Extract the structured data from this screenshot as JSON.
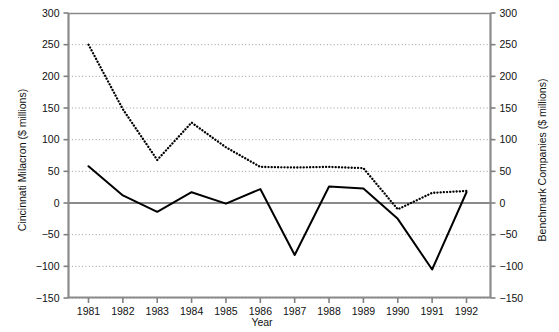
{
  "chart_data": {
    "type": "line",
    "title": "",
    "xlabel": "Year",
    "ylabel_left": "Cincinnati Milacron ($ millions)",
    "ylabel_right": "Benchmark Companies ($ millions)",
    "categories": [
      1981,
      1982,
      1983,
      1984,
      1985,
      1986,
      1987,
      1988,
      1989,
      1990,
      1991,
      1992
    ],
    "x_tick_labels": [
      "1981",
      "1982",
      "1983",
      "1984",
      "1985",
      "1986",
      "1987",
      "1988",
      "1989",
      "1990",
      "1991",
      "1992"
    ],
    "y_tick_labels_left": [
      "300",
      "250",
      "200",
      "150",
      "100",
      "50",
      "0",
      "-50",
      "-100",
      "-150"
    ],
    "y_tick_labels_right": [
      "300",
      "250",
      "200",
      "150",
      "100",
      "50",
      "0",
      "-50",
      "-100",
      "-150"
    ],
    "y_tick_values": [
      300,
      250,
      200,
      150,
      100,
      50,
      0,
      -50,
      -100,
      -150
    ],
    "ylim": [
      -150,
      300
    ],
    "ylim_right": [
      -150,
      300
    ],
    "grid": true,
    "legend": "none",
    "series": [
      {
        "name": "Cincinnati Milacron ($ millions)",
        "axis": "left",
        "style": "solid",
        "color": "#000000",
        "values": [
          58,
          12,
          -14,
          17,
          -1,
          22,
          -82,
          26,
          23,
          -25,
          -105,
          17
        ]
      },
      {
        "name": "Benchmark Companies ($ millions)",
        "axis": "right",
        "style": "dotted",
        "color": "#000000",
        "values": [
          250,
          148,
          68,
          127,
          88,
          57,
          56,
          57,
          55,
          -10,
          16,
          19
        ]
      }
    ],
    "annotations": []
  },
  "colors": {
    "axis": "#808080",
    "grid": "#999999",
    "zero_line": "#808080",
    "data": "#000000",
    "background": "#ffffff"
  }
}
